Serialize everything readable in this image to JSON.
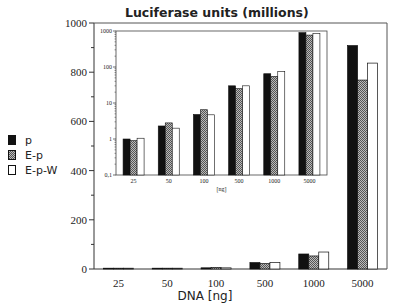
{
  "chart_data": [
    {
      "type": "bar",
      "title": "Luciferase units (millions)",
      "xlabel": "DNA [ng]",
      "ylabel": "Luciferase units (millions)",
      "categories": [
        "25",
        "50",
        "100",
        "500",
        "1000",
        "5000"
      ],
      "ylim": [
        0,
        1000
      ],
      "yticks": [
        0,
        200,
        400,
        600,
        800,
        1000
      ],
      "grid": false,
      "legend_position": "left",
      "series": [
        {
          "name": "p",
          "fill": "black",
          "values": [
            1.0,
            2.3,
            4.8,
            26,
            61,
            908
          ]
        },
        {
          "name": "E-p",
          "fill": "hatched-gray",
          "values": [
            0.9,
            2.8,
            6.5,
            22,
            53,
            768
          ]
        },
        {
          "name": "E-p-W",
          "fill": "white",
          "values": [
            1.05,
            2.0,
            4.7,
            27,
            69,
            837
          ]
        }
      ]
    },
    {
      "type": "bar",
      "title": "inset (log scale)",
      "xlabel": "[ng]",
      "yscale": "log",
      "categories": [
        "25",
        "50",
        "100",
        "500",
        "1000",
        "5000"
      ],
      "ylim": [
        0.1,
        1000
      ],
      "yticks": [
        "0,1",
        "1",
        "10",
        "100",
        "1000"
      ],
      "series": [
        {
          "name": "p",
          "values": [
            1.0,
            2.3,
            4.8,
            30,
            65,
            900
          ]
        },
        {
          "name": "E-p",
          "values": [
            0.9,
            2.8,
            6.5,
            25,
            55,
            770
          ]
        },
        {
          "name": "E-p-W",
          "values": [
            1.05,
            2.0,
            4.7,
            30,
            75,
            850
          ]
        }
      ]
    }
  ],
  "labels": {
    "title": "Luciferase units (millions)",
    "xlabel": "DNA [ng]",
    "inset_xlabel": "[ng]",
    "yticks": [
      "0",
      "200",
      "400",
      "600",
      "800",
      "1000"
    ],
    "inset_yticks": [
      "0,1",
      "1",
      "10",
      "100",
      "1000"
    ],
    "categories": [
      "25",
      "50",
      "100",
      "500",
      "1000",
      "5000"
    ]
  },
  "legend": [
    {
      "label": "p",
      "fill": "#111111"
    },
    {
      "label": "E-p",
      "fill": "hatched"
    },
    {
      "label": "E-p-W",
      "fill": "#ffffff"
    }
  ]
}
